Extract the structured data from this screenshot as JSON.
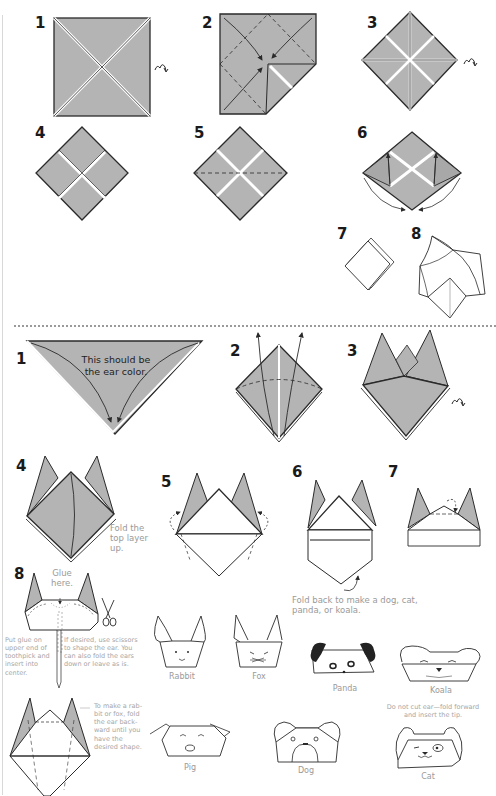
{
  "colors": {
    "paper_gray": "#b4b4b4",
    "line": "#2a2a2a",
    "caption": "#9a9a9a",
    "background": "#ffffff"
  },
  "part1": {
    "steps": [
      {
        "number": "1",
        "icon": "turn-over-icon"
      },
      {
        "number": "2"
      },
      {
        "number": "3",
        "icon": "turn-over-icon"
      },
      {
        "number": "4"
      },
      {
        "number": "5"
      },
      {
        "number": "6"
      },
      {
        "number": "7"
      },
      {
        "number": "8"
      }
    ]
  },
  "part2": {
    "steps": [
      {
        "number": "1",
        "note": "This should be the ear color.",
        "note_line1": "This should be",
        "note_line2": "the ear color."
      },
      {
        "number": "2"
      },
      {
        "number": "3",
        "icon": "turn-over-icon"
      },
      {
        "number": "4",
        "caption_line1": "Fold the",
        "caption_line2": "top layer",
        "caption_line3": "up."
      },
      {
        "number": "5"
      },
      {
        "number": "6",
        "caption_line1": "Fold back to make a dog, cat,",
        "caption_line2": "panda, or koala."
      },
      {
        "number": "7"
      },
      {
        "number": "8",
        "glue_line1": "Glue",
        "glue_line2": "here."
      }
    ],
    "notes": {
      "toothpick": [
        "Put glue on",
        "upper end of",
        "toothpick and",
        "insert into",
        "center."
      ],
      "scissors": [
        "If desired, use scissors",
        "to shape the ear. You",
        "can also fold the ears",
        "down or leave as is."
      ],
      "rabbit_fox": [
        "To make a rab-",
        "bit or fox, fold",
        "the ear back-",
        "ward until you",
        "have the",
        "desired shape."
      ],
      "cat": [
        "Do not cut ear—fold forward",
        "and insert the tip."
      ]
    },
    "animals": [
      {
        "name": "Rabbit"
      },
      {
        "name": "Fox"
      },
      {
        "name": "Panda"
      },
      {
        "name": "Koala"
      },
      {
        "name": "Pig"
      },
      {
        "name": "Dog"
      },
      {
        "name": "Cat"
      }
    ]
  }
}
